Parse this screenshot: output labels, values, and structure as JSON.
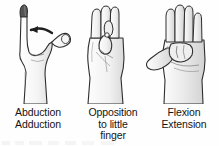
{
  "figure": {
    "kind": "anatomical-illustration",
    "background_color": "#fefefe",
    "ink_color": "#2b2b2b",
    "fill_color": "#f2f2f2",
    "shade_color": "#d8d8d8"
  },
  "panels": [
    {
      "id": "abduction-adduction",
      "illustration_name": "hand-abduction-adduction-illustration",
      "has_motion_arrow": true,
      "arrow_name": "abduction-arrow-icon",
      "caption_lines": [
        "Abduction",
        "Adduction"
      ]
    },
    {
      "id": "opposition-to-little-finger",
      "illustration_name": "hand-opposition-illustration",
      "has_motion_arrow": false,
      "caption_lines": [
        "Opposition",
        "to little",
        "finger"
      ]
    },
    {
      "id": "flexion-extension",
      "illustration_name": "hand-flexion-extension-illustration",
      "has_motion_arrow": false,
      "caption_lines": [
        "Flexion",
        "Extension"
      ]
    }
  ]
}
